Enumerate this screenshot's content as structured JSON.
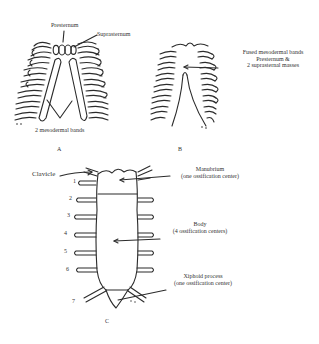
{
  "figure": {
    "panels": [
      {
        "id": "A",
        "caption": "A",
        "labels": {
          "presternum": "Presternum",
          "suprasternum": "Suprasternum",
          "bands": "2 mesodermal bands"
        }
      },
      {
        "id": "B",
        "caption": "B",
        "labels": {
          "line1": "Fused mesodermal bands",
          "line2": "Presternum &",
          "line3": "2 suprasternal masses"
        }
      },
      {
        "id": "C",
        "caption": "C",
        "labels": {
          "clavicle": "Clavicle",
          "manubrium": "Manubrium",
          "manubrium_note": "(one ossification center)",
          "body": "Body",
          "body_note": "(4 ossification centers)",
          "xiphoid": "Xiphoid process",
          "xiphoid_note": "(one ossification center)"
        },
        "rib_numbers": [
          "1",
          "2",
          "3",
          "4",
          "5",
          "6",
          "7"
        ]
      }
    ]
  }
}
